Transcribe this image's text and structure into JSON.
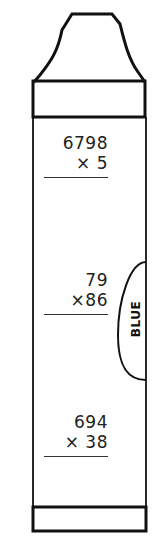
{
  "worksheet": {
    "crayon_label": "BLUE",
    "problems": [
      {
        "top": "6798",
        "bottom": "× 5"
      },
      {
        "top": "79",
        "bottom": "×86"
      },
      {
        "top": "694",
        "bottom": "× 38"
      }
    ]
  },
  "colors": {
    "ink": "#111111",
    "paper": "#ffffff"
  }
}
